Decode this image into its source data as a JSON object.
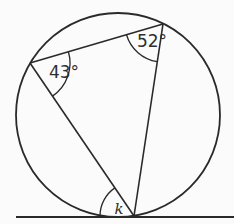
{
  "figure": {
    "background": "#fbfbfb",
    "stroke_color": "#2a2a2a",
    "label_color": "#2e2e2e",
    "circle": {
      "cx": 118,
      "cy": 115,
      "r": 102
    },
    "tangent_line": {
      "x1": 16,
      "y1": 217,
      "x2": 234,
      "y2": 217
    },
    "vertices": {
      "A": {
        "x": 30,
        "y": 63
      },
      "B": {
        "x": 163,
        "y": 24
      },
      "C": {
        "x": 134,
        "y": 216
      }
    },
    "chords": [
      {
        "from": "A",
        "to": "B"
      },
      {
        "from": "A",
        "to": "C"
      },
      {
        "from": "B",
        "to": "C"
      }
    ],
    "angle_marks": [
      {
        "vertex": "A",
        "from": "B",
        "to": "C",
        "radius": 40,
        "label": "43°",
        "label_x": 64,
        "label_y": 72
      },
      {
        "vertex": "B",
        "from": "A",
        "to": "C",
        "radius": 38,
        "label": "52°",
        "label_x": 152,
        "label_y": 41
      },
      {
        "vertex": "C",
        "from": "A",
        "to": "tangent_left",
        "radius": 34,
        "label": "k",
        "label_x": 119,
        "label_y": 209
      }
    ]
  }
}
